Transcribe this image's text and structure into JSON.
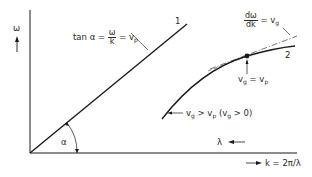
{
  "diagram": {
    "type": "dispersion-relation",
    "axes": {
      "y_label": "ω",
      "x_label_k": "k = 2π/λ",
      "x_label_lambda": "λ"
    },
    "curves": [
      {
        "id": "1",
        "label": "1",
        "description": "straight line, non-dispersive"
      },
      {
        "id": "2",
        "label": "2",
        "description": "dispersive curve"
      }
    ],
    "annotations": {
      "phase_velocity": {
        "prefix": "tan α =",
        "num": "ω",
        "den": "k",
        "suffix": "= v",
        "suffix_sub": "p"
      },
      "group_velocity": {
        "num": "dω",
        "den": "dk",
        "suffix": "= v",
        "suffix_sub": "g"
      },
      "equal_point": {
        "a": "v",
        "a_sub": "g",
        "eq": " = v",
        "b_sub": "p"
      },
      "condition": {
        "a": "v",
        "a_sub": "g",
        "mid": " > v",
        "mid_sub": "p",
        "paren_open": " (v",
        "paren_sub": "g",
        "paren_close": " > 0)"
      },
      "angle": "α"
    },
    "colors": {
      "line": "#1a1a1a",
      "background": "#ffffff"
    }
  }
}
